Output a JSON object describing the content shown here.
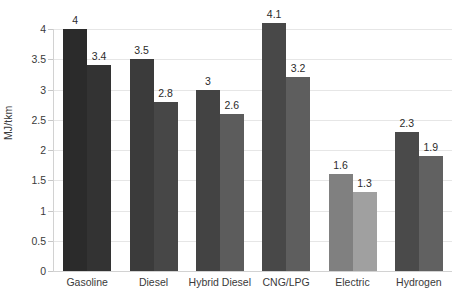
{
  "chart_data": {
    "type": "bar",
    "title": "",
    "subtitle": "",
    "xlabel": "",
    "ylabel": "MJ/tkm",
    "ylim": [
      0,
      4
    ],
    "ytick_labels": [
      "0",
      "0.5",
      "1",
      "1.5",
      "2",
      "2.5",
      "3",
      "3.5",
      "4"
    ],
    "ytick_values": [
      0,
      0.5,
      1,
      1.5,
      2,
      2.5,
      3,
      3.5,
      4
    ],
    "grid": true,
    "grid_axis": "y",
    "legend": false,
    "legend_position": "none",
    "categories": [
      "Gasoline",
      "Diesel",
      "Hybrid Diesel",
      "CNG/LPG",
      "Electric",
      "Hydrogen"
    ],
    "series": [
      {
        "name": "Series 1",
        "values": [
          4,
          3.5,
          3,
          4.1,
          1.6,
          2.3
        ],
        "labels": [
          "4",
          "3.5",
          "3",
          "4.1",
          "1.6",
          "2.3"
        ],
        "colors": [
          "#2b2b2b",
          "#3b3b3b",
          "#434343",
          "#484848",
          "#808080",
          "#4a4a4a"
        ]
      },
      {
        "name": "Series 2",
        "values": [
          3.4,
          2.8,
          2.6,
          3.2,
          1.3,
          1.9
        ],
        "labels": [
          "3.4",
          "2.8",
          "2.6",
          "3.2",
          "1.3",
          "1.9"
        ],
        "colors": [
          "#333333",
          "#474747",
          "#5c5c5c",
          "#5e5e5e",
          "#a0a0a0",
          "#616161"
        ]
      }
    ],
    "colors": {
      "gridline": "#e6e6e6",
      "axis": "#d2d2d2",
      "text": "#3a3a3a",
      "label_text": "#2b2b2b",
      "background": "#ffffff"
    }
  }
}
